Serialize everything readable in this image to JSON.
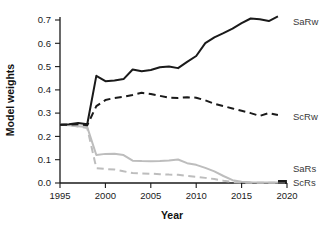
{
  "chart_data": {
    "type": "line",
    "title": "",
    "xlabel": "Year",
    "ylabel": "Model weights",
    "xlim": [
      1995,
      2020
    ],
    "ylim": [
      0.0,
      0.74
    ],
    "grid": false,
    "legend_position": "right-of-axes-inline",
    "xticks": [
      1995,
      2000,
      2005,
      2010,
      2015,
      2020
    ],
    "xtick_labels": [
      "1995",
      "2000",
      "2005",
      "2010",
      "2015",
      "2020"
    ],
    "yticks": [
      0.0,
      0.1,
      0.2,
      0.3,
      0.4,
      0.5,
      0.6,
      0.7
    ],
    "ytick_labels": [
      "0.0",
      "0.1",
      "0.2",
      "0.3",
      "0.4",
      "0.5",
      "0.6",
      "0.7"
    ],
    "x": [
      1995,
      1996,
      1997,
      1998,
      1999,
      2000,
      2001,
      2002,
      2003,
      2004,
      2005,
      2006,
      2007,
      2008,
      2009,
      2010,
      2011,
      2012,
      2013,
      2014,
      2015,
      2016,
      2017,
      2018,
      2019
    ],
    "series": [
      {
        "name": "SaRw",
        "label": "SaRw",
        "color": "#1a1a1a",
        "style": "solid",
        "width": 2.0,
        "values": [
          0.25,
          0.252,
          0.258,
          0.252,
          0.46,
          0.437,
          0.44,
          0.446,
          0.487,
          0.48,
          0.485,
          0.497,
          0.5,
          0.493,
          0.52,
          0.545,
          0.6,
          0.625,
          0.643,
          0.663,
          0.686,
          0.706,
          0.703,
          0.695,
          0.715
        ]
      },
      {
        "name": "ScRw",
        "label": "ScRw",
        "color": "#1a1a1a",
        "style": "dashed",
        "width": 2.0,
        "values": [
          0.25,
          0.25,
          0.252,
          0.248,
          0.33,
          0.356,
          0.365,
          0.37,
          0.378,
          0.387,
          0.382,
          0.374,
          0.366,
          0.365,
          0.368,
          0.366,
          0.355,
          0.34,
          0.33,
          0.32,
          0.31,
          0.3,
          0.288,
          0.3,
          0.292
        ]
      },
      {
        "name": "SaRs",
        "label": "SaRs",
        "color": "#bdbdbd",
        "style": "solid",
        "width": 2.0,
        "values": [
          0.25,
          0.248,
          0.244,
          0.24,
          0.12,
          0.125,
          0.126,
          0.12,
          0.096,
          0.094,
          0.093,
          0.094,
          0.097,
          0.101,
          0.085,
          0.078,
          0.065,
          0.05,
          0.03,
          0.012,
          0.005,
          0.003,
          0.002,
          0.002,
          0.002
        ]
      },
      {
        "name": "ScRs",
        "label": "ScRs",
        "color": "#bdbdbd",
        "style": "dashed",
        "width": 2.0,
        "values": [
          0.25,
          0.248,
          0.242,
          0.236,
          0.064,
          0.06,
          0.058,
          0.05,
          0.043,
          0.041,
          0.04,
          0.038,
          0.036,
          0.035,
          0.03,
          0.027,
          0.022,
          0.017,
          0.01,
          0.004,
          0.002,
          0.001,
          0.001,
          0.001,
          0.001
        ]
      }
    ]
  },
  "labels": {
    "ylabel": "Model weights",
    "xlabel": "Year",
    "series_saRw": "SaRw",
    "series_scRw": "ScRw",
    "series_saRs": "SaRs",
    "series_scRs": "ScRs",
    "ytick_0": "0.0",
    "ytick_1": "0.1",
    "ytick_2": "0.2",
    "ytick_3": "0.3",
    "ytick_4": "0.4",
    "ytick_5": "0.5",
    "ytick_6": "0.6",
    "ytick_7": "0.7",
    "xtick_0": "1995",
    "xtick_1": "2000",
    "xtick_2": "2005",
    "xtick_3": "2010",
    "xtick_4": "2015",
    "xtick_5": "2020"
  },
  "colors": {
    "dark": "#1a1a1a",
    "light": "#bdbdbd",
    "background": "#ffffff"
  }
}
